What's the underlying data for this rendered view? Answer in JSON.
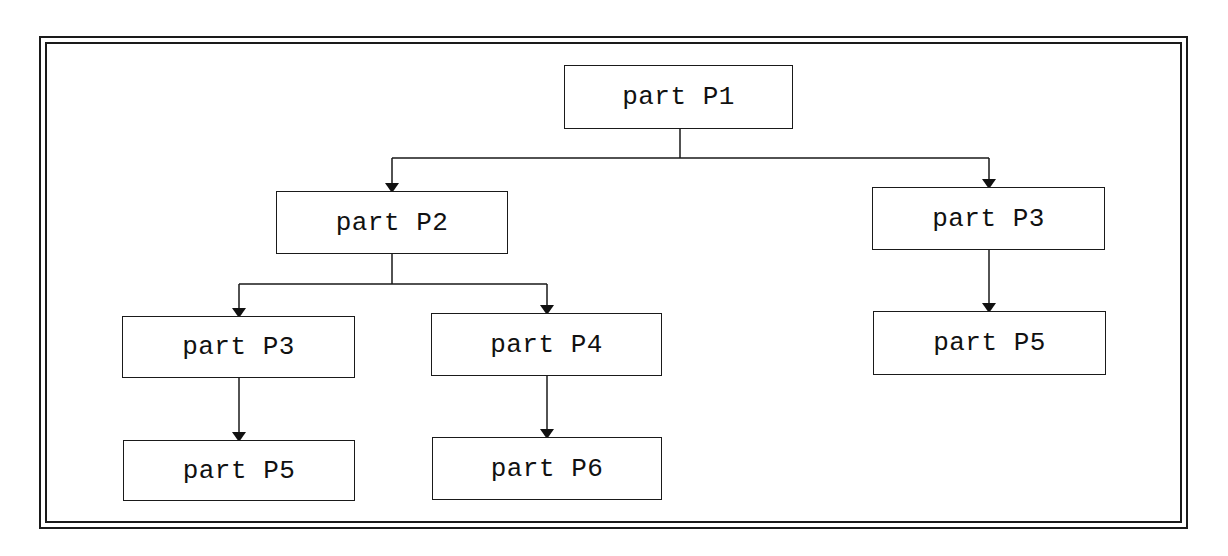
{
  "diagram": {
    "type": "tree",
    "nodes": [
      {
        "id": "n1",
        "label": "part P1",
        "x": 564,
        "y": 65,
        "w": 229,
        "h": 64
      },
      {
        "id": "n2",
        "label": "part P2",
        "x": 276,
        "y": 191,
        "w": 232,
        "h": 63
      },
      {
        "id": "n3",
        "label": "part P3",
        "x": 872,
        "y": 187,
        "w": 233,
        "h": 63
      },
      {
        "id": "n4",
        "label": "part P3",
        "x": 122,
        "y": 316,
        "w": 233,
        "h": 62
      },
      {
        "id": "n5",
        "label": "part P4",
        "x": 431,
        "y": 313,
        "w": 231,
        "h": 63
      },
      {
        "id": "n6",
        "label": "part P5",
        "x": 873,
        "y": 311,
        "w": 233,
        "h": 64
      },
      {
        "id": "n7",
        "label": "part P5",
        "x": 123,
        "y": 440,
        "w": 232,
        "h": 61
      },
      {
        "id": "n8",
        "label": "part P6",
        "x": 432,
        "y": 437,
        "w": 230,
        "h": 63
      }
    ],
    "edges": [
      {
        "from": "n1",
        "to": "n2"
      },
      {
        "from": "n1",
        "to": "n3"
      },
      {
        "from": "n2",
        "to": "n4"
      },
      {
        "from": "n2",
        "to": "n5"
      },
      {
        "from": "n3",
        "to": "n6"
      },
      {
        "from": "n4",
        "to": "n7"
      },
      {
        "from": "n5",
        "to": "n8"
      }
    ]
  }
}
